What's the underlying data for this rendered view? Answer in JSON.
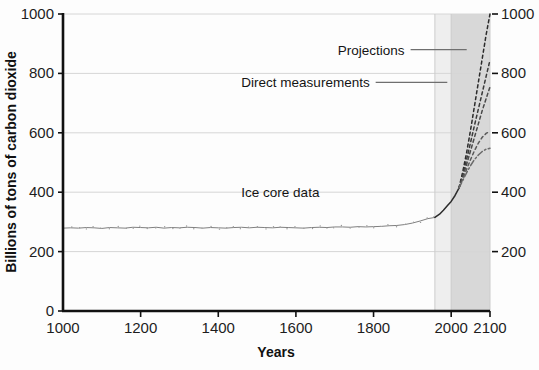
{
  "chart_data": {
    "type": "line",
    "title": "",
    "xlabel": "Years",
    "ylabel": "Billions of tons of carbon dioxide",
    "xlim": [
      1000,
      2100
    ],
    "ylim": [
      0,
      1000
    ],
    "grid": true,
    "legend_position": "none",
    "x_ticks": [
      "1000",
      "1200",
      "1400",
      "1600",
      "1800",
      "2000",
      "2100"
    ],
    "x_tick_values": [
      1000,
      1200,
      1400,
      1600,
      1800,
      2000,
      2100
    ],
    "y_ticks_left": [
      "0",
      "200",
      "400",
      "600",
      "800",
      "1000"
    ],
    "y_tick_values_left": [
      0,
      200,
      400,
      600,
      800,
      1000
    ],
    "y_ticks_right": [
      "200",
      "400",
      "600",
      "800",
      "1000"
    ],
    "y_tick_values_right": [
      200,
      400,
      600,
      800,
      1000
    ],
    "annotations": [
      {
        "text": "Projections",
        "x": 1880,
        "y": 880
      },
      {
        "text": "Direct measurements",
        "x": 1790,
        "y": 770
      },
      {
        "text": "Ice core data",
        "x": 1560,
        "y": 400
      }
    ],
    "shaded_bands": [
      {
        "name": "direct-measurements-band",
        "x_start": 1958,
        "x_end": 2000,
        "color": "#eeeeee"
      },
      {
        "name": "projections-band",
        "x_start": 2000,
        "x_end": 2100,
        "color": "#d8d8d8"
      }
    ],
    "series": [
      {
        "name": "Ice core data",
        "style": "noisy-line",
        "color": "#808080",
        "x": [
          1000,
          1020,
          1040,
          1060,
          1080,
          1100,
          1120,
          1140,
          1160,
          1180,
          1200,
          1220,
          1240,
          1260,
          1280,
          1300,
          1320,
          1340,
          1360,
          1380,
          1400,
          1420,
          1440,
          1460,
          1480,
          1500,
          1520,
          1540,
          1560,
          1580,
          1600,
          1620,
          1640,
          1660,
          1680,
          1700,
          1720,
          1740,
          1760,
          1780,
          1800,
          1820,
          1840,
          1860,
          1880,
          1900,
          1920,
          1940,
          1958
        ],
        "values": [
          279,
          280,
          279,
          281,
          280,
          278,
          281,
          280,
          279,
          282,
          281,
          280,
          282,
          279,
          281,
          280,
          282,
          281,
          279,
          281,
          280,
          279,
          281,
          282,
          280,
          282,
          281,
          280,
          282,
          281,
          280,
          279,
          281,
          282,
          281,
          283,
          283,
          282,
          284,
          283,
          284,
          285,
          287,
          288,
          291,
          296,
          303,
          311,
          315
        ]
      },
      {
        "name": "Direct measurements",
        "style": "solid",
        "color": "#2b2b2b",
        "x": [
          1958,
          1970,
          1980,
          1990,
          2000,
          2010,
          2020
        ],
        "values": [
          315,
          326,
          339,
          354,
          369,
          389,
          414
        ]
      },
      {
        "name": "Projection A (highest)",
        "style": "dashed",
        "color": "#2b2b2b",
        "x": [
          2020,
          2030,
          2040,
          2050,
          2060,
          2070,
          2080,
          2090,
          2100
        ],
        "values": [
          414,
          470,
          535,
          610,
          690,
          770,
          850,
          930,
          1000
        ]
      },
      {
        "name": "Projection B",
        "style": "dashed",
        "color": "#3a3a3a",
        "x": [
          2020,
          2030,
          2040,
          2050,
          2060,
          2070,
          2080,
          2090,
          2100
        ],
        "values": [
          414,
          460,
          512,
          568,
          625,
          680,
          735,
          790,
          845
        ]
      },
      {
        "name": "Projection C",
        "style": "dashed",
        "color": "#4a4a4a",
        "x": [
          2020,
          2030,
          2040,
          2050,
          2060,
          2070,
          2080,
          2090,
          2100
        ],
        "values": [
          414,
          452,
          495,
          540,
          585,
          630,
          675,
          715,
          755
        ]
      },
      {
        "name": "Projection D",
        "style": "dashed",
        "color": "#5a5a5a",
        "x": [
          2020,
          2030,
          2040,
          2050,
          2060,
          2070,
          2080,
          2090,
          2100
        ],
        "values": [
          414,
          445,
          478,
          510,
          540,
          565,
          585,
          598,
          605
        ]
      },
      {
        "name": "Projection E (lowest)",
        "style": "dash-dot",
        "color": "#6a6a6a",
        "x": [
          2020,
          2030,
          2040,
          2050,
          2060,
          2070,
          2080,
          2090,
          2100
        ],
        "values": [
          414,
          440,
          466,
          490,
          510,
          525,
          537,
          545,
          548
        ]
      }
    ]
  }
}
